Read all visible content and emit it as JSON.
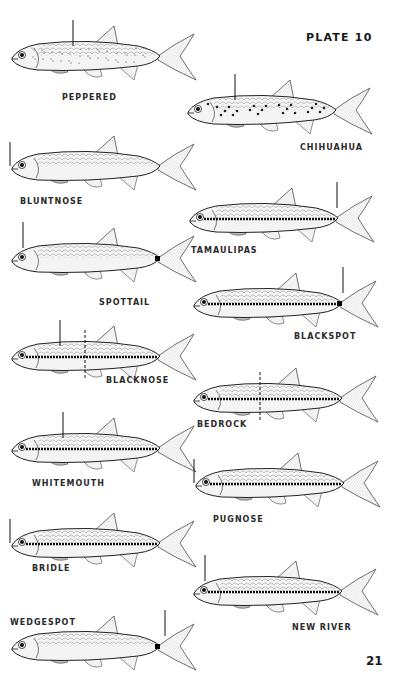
{
  "page": {
    "plate_title": "PLATE 10",
    "page_number": "21"
  },
  "fish": [
    {
      "name": "PEPPERED",
      "x": 8,
      "y": 18,
      "label_x": 62,
      "label_y": 93,
      "marks": {
        "arrow_top": 73,
        "speckles": true
      }
    },
    {
      "name": "CHIHUAHUA",
      "x": 184,
      "y": 72,
      "label_x": 300,
      "label_y": 143,
      "marks": {
        "arrow_top": 235,
        "spots": true
      }
    },
    {
      "name": "BLUNTNOSE",
      "x": 8,
      "y": 128,
      "label_x": 20,
      "label_y": 197,
      "marks": {
        "arrow_left": 12
      }
    },
    {
      "name": "TAMAULIPAS",
      "x": 186,
      "y": 180,
      "label_x": 191,
      "label_y": 246,
      "marks": {
        "arrow_top": 337,
        "stripe": true
      }
    },
    {
      "name": "SPOTTAIL",
      "x": 8,
      "y": 220,
      "label_x": 99,
      "label_y": 298,
      "marks": {
        "arrow_top": 23,
        "tail_spot": true
      }
    },
    {
      "name": "BLACKSPOT",
      "x": 190,
      "y": 265,
      "label_x": 294,
      "label_y": 332,
      "marks": {
        "arrow_top": 343,
        "stripe": true,
        "tail_spot": true
      }
    },
    {
      "name": "BLACKNOSE",
      "x": 8,
      "y": 318,
      "label_x": 106,
      "label_y": 376,
      "marks": {
        "arrow_top": 60,
        "dashed": 85,
        "stripe": true
      }
    },
    {
      "name": "BEDROCK",
      "x": 190,
      "y": 360,
      "label_x": 197,
      "label_y": 420,
      "marks": {
        "dashed": 260,
        "stripe": true
      }
    },
    {
      "name": "WHITEMOUTH",
      "x": 8,
      "y": 410,
      "label_x": 32,
      "label_y": 479,
      "marks": {
        "arrow_top": 63,
        "stripe": true
      }
    },
    {
      "name": "PUGNOSE",
      "x": 192,
      "y": 445,
      "label_x": 213,
      "label_y": 515,
      "marks": {
        "arrow_left": 168,
        "stripe": true
      }
    },
    {
      "name": "BRIDLE",
      "x": 8,
      "y": 505,
      "label_x": 32,
      "label_y": 564,
      "marks": {
        "arrow_left": 9,
        "stripe": true
      }
    },
    {
      "name": "NEW RIVER",
      "x": 190,
      "y": 553,
      "label_x": 292,
      "label_y": 623,
      "marks": {
        "arrow_top": 205,
        "stripe": true
      }
    },
    {
      "name": "WEDGESPOT",
      "x": 8,
      "y": 608,
      "label_x": 10,
      "label_y": 618,
      "marks": {
        "arrow_top": 165,
        "tail_spot": true
      }
    }
  ]
}
